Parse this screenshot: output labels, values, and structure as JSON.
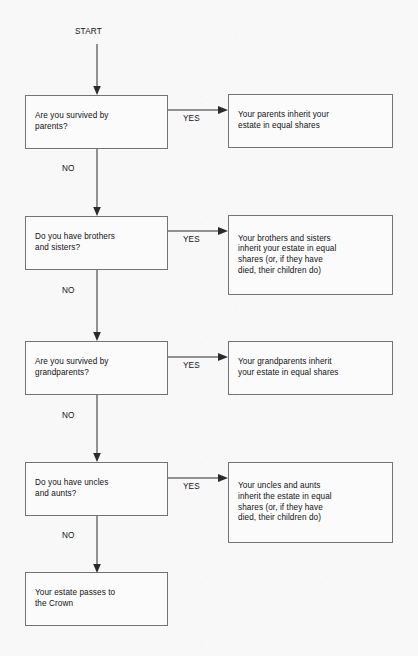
{
  "diagram": {
    "start_label": "START",
    "yes_label": "YES",
    "no_label": "NO",
    "line_color": "#2b2b2b",
    "box_border_color": "#737373",
    "background_color": "#f8f8f9",
    "text_color": "#121212",
    "nodes": [
      {
        "id": "q1",
        "kind": "decision",
        "text": "Are you survived by\nparents?"
      },
      {
        "id": "a1",
        "kind": "outcome",
        "text": "Your parents inherit your\nestate in equal shares"
      },
      {
        "id": "q2",
        "kind": "decision",
        "text": "Do you have brothers\nand sisters?"
      },
      {
        "id": "a2",
        "kind": "outcome",
        "text": "Your brothers and sisters\ninherit your estate in equal\nshares (or, if they have\ndied, their children do)"
      },
      {
        "id": "q3",
        "kind": "decision",
        "text": "Are you survived by\ngrandparents?"
      },
      {
        "id": "a3",
        "kind": "outcome",
        "text": "Your grandparents inherit\nyour estate in equal shares"
      },
      {
        "id": "q4",
        "kind": "decision",
        "text": "Do you have uncles\nand aunts?"
      },
      {
        "id": "a4",
        "kind": "outcome",
        "text": "Your uncles and aunts\ninherit the estate in equal\nshares (or, if they have\ndied, their children do)"
      },
      {
        "id": "end",
        "kind": "terminal",
        "text": "Your estate passes to\nthe Crown"
      }
    ]
  }
}
